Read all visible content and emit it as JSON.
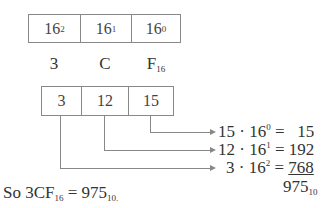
{
  "place_values": {
    "base": "16",
    "exponents": [
      "2",
      "1",
      "0"
    ]
  },
  "hex_digits": {
    "digits": [
      "3",
      "C",
      "F"
    ],
    "base_subscript": "16"
  },
  "decimal_values": [
    "3",
    "12",
    "15"
  ],
  "equations": [
    {
      "digit": "15",
      "op": "·",
      "base": "16",
      "exp": "0",
      "eq": "=",
      "result": "15"
    },
    {
      "digit": "12",
      "op": "·",
      "base": "16",
      "exp": "1",
      "eq": "=",
      "result": "192"
    },
    {
      "digit": "3",
      "op": "·",
      "base": "16",
      "exp": "2",
      "eq": "=",
      "result": "768"
    }
  ],
  "sum": {
    "value": "975",
    "base_subscript": "10"
  },
  "conclusion": {
    "prefix": "So 3CF",
    "left_subscript": "16",
    "equals": "=",
    "value": "975",
    "right_subscript": "10."
  }
}
